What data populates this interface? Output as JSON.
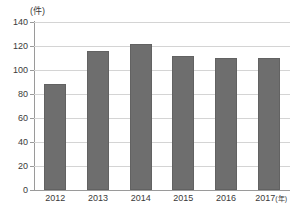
{
  "chart_data": {
    "type": "bar",
    "title": "",
    "subtitle": "",
    "xlabel": "(年)",
    "ylabel": "(件)",
    "unit_top_label": "(件)",
    "unit_right_label": "(年)",
    "categories": [
      "2012",
      "2013",
      "2014",
      "2015",
      "2016",
      "2017"
    ],
    "values": [
      88,
      116,
      122,
      112,
      110,
      110
    ],
    "series": [
      {
        "name": "件数",
        "values": [
          88,
          116,
          122,
          112,
          110,
          110
        ]
      }
    ],
    "ylim": [
      0,
      140
    ],
    "ytick_values": [
      0,
      20,
      40,
      60,
      80,
      100,
      120,
      140
    ],
    "ytick_labels": [
      "0",
      "20",
      "40",
      "60",
      "80",
      "100",
      "120",
      "140"
    ],
    "grid": true,
    "grid_axis": "y",
    "legend": false,
    "legend_position": "none",
    "bar_color": "#6e6e6e",
    "bar_edge_color": "#626262",
    "gridline_color": "#d4d4d4",
    "axis_color": "#9a9a9a",
    "text_color": "#3a3a3a",
    "background_color": "#ffffff"
  }
}
